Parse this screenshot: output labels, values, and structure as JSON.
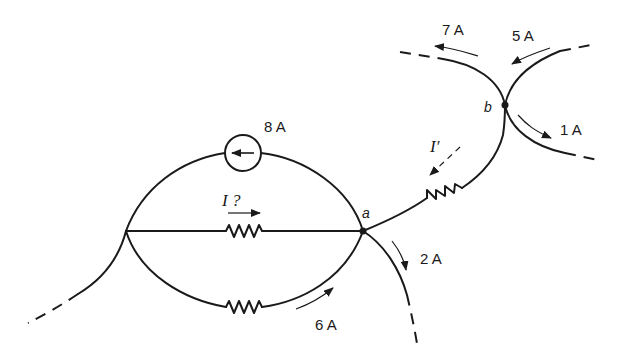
{
  "diagram": {
    "type": "circuit",
    "nodes": {
      "a": "a",
      "b": "b"
    },
    "currents": {
      "source": "8 A",
      "unknown": "I ?",
      "prime": "I′",
      "a_out": "2 A",
      "bottom_branch": "6 A",
      "b_top_left": "7 A",
      "b_top_right": "5 A",
      "b_bottom_right": "1 A"
    },
    "colors": {
      "ink": "#1a1a1a",
      "background": "#ffffff"
    }
  }
}
